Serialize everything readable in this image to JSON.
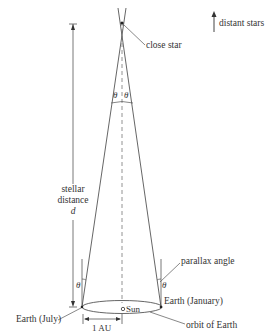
{
  "diagram": {
    "labels": {
      "distant_stars": "distant stars",
      "close_star": "close star",
      "theta_top_left": "θ",
      "theta_top_right": "θ",
      "stellar": "stellar",
      "distance": "distance",
      "d": "d",
      "parallax_angle": "parallax angle",
      "theta_left": "θ",
      "theta_right": "θ",
      "earth_january": "Earth (January)",
      "sun": "Sun",
      "earth_july": "Earth (July)",
      "one_au": "1 AU",
      "orbit_of_earth": "orbit of Earth"
    },
    "colors": {
      "line": "#444444",
      "text": "#333333",
      "background": "#ffffff"
    }
  }
}
